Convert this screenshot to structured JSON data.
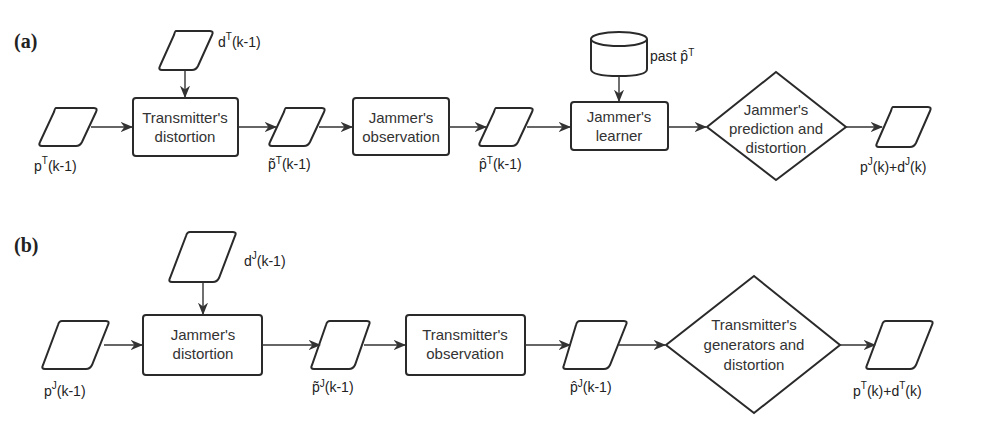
{
  "diagram": {
    "panels": [
      {
        "tag": "(a)",
        "nodes": {
          "input_param": {
            "type": "data",
            "label_base": "p",
            "label_sup": "T",
            "label_rest": "(k-1)"
          },
          "input_distortion": {
            "type": "data",
            "label_base": "d",
            "label_sup": "T",
            "label_rest": "(k-1)"
          },
          "process_1": {
            "type": "process",
            "lines": [
              "Transmitter's",
              "distortion"
            ]
          },
          "mid_data_1": {
            "type": "data",
            "label_base": "p̃",
            "label_sup": "T",
            "label_rest": "(k-1)"
          },
          "process_2": {
            "type": "process",
            "lines": [
              "Jammer's",
              "observation"
            ]
          },
          "mid_data_2": {
            "type": "data",
            "label_base": "p̂",
            "label_sup": "T",
            "label_rest": "(k-1)"
          },
          "storage": {
            "type": "database",
            "label_base": "past p̂",
            "label_sup": "T"
          },
          "process_3": {
            "type": "process",
            "lines": [
              "Jammer's",
              "learner"
            ]
          },
          "decision": {
            "type": "decision",
            "lines": [
              "Jammer's",
              "prediction and",
              "distortion"
            ]
          },
          "output": {
            "type": "data",
            "label_a": "p",
            "sup_a": "J",
            "label_b": "(k)+d",
            "sup_b": "J",
            "label_c": "(k)"
          }
        }
      },
      {
        "tag": "(b)",
        "nodes": {
          "input_param": {
            "type": "data",
            "label_base": "p",
            "label_sup": "J",
            "label_rest": "(k-1)"
          },
          "input_distortion": {
            "type": "data",
            "label_base": "d",
            "label_sup": "J",
            "label_rest": "(k-1)"
          },
          "process_1": {
            "type": "process",
            "lines": [
              "Jammer's",
              "distortion"
            ]
          },
          "mid_data_1": {
            "type": "data",
            "label_base": "p̃",
            "label_sup": "J",
            "label_rest": "(k-1)"
          },
          "process_2": {
            "type": "process",
            "lines": [
              "Transmitter's",
              "observation"
            ]
          },
          "mid_data_2": {
            "type": "data",
            "label_base": "p̂",
            "label_sup": "J",
            "label_rest": "(k-1)"
          },
          "decision": {
            "type": "decision",
            "lines": [
              "Transmitter's",
              "generators and",
              "distortion"
            ]
          },
          "output": {
            "type": "data",
            "label_a": "p",
            "sup_a": "T",
            "label_b": "(k)+d",
            "sup_b": "T",
            "label_c": "(k)"
          }
        }
      }
    ],
    "colors": {
      "stroke": "#2a2a2a",
      "text": "#333333",
      "background": "#ffffff"
    }
  }
}
